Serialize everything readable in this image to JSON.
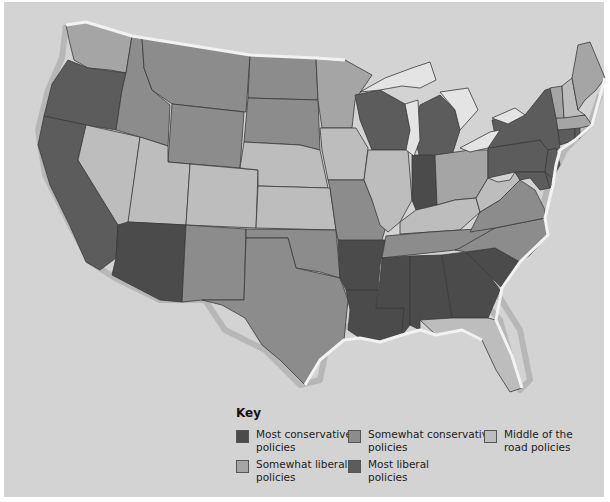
{
  "map": {
    "subject": "United States state policy leanings",
    "background_color": "#d3d3d3",
    "categories": {
      "most_conservative": {
        "label": "Most conservative policies",
        "color": "#4b4b4b"
      },
      "somewhat_conservative": {
        "label": "Somewhat conservative policies",
        "color": "#8c8c8c"
      },
      "middle": {
        "label": "Middle of the road policies",
        "color": "#bdbdbd"
      },
      "somewhat_liberal": {
        "label": "Somewhat liberal policies",
        "color": "#a5a5a5"
      },
      "most_liberal": {
        "label": "Most liberal policies",
        "color": "#5c5c5c"
      }
    },
    "states": {
      "WA": "somewhat_liberal",
      "OR": "most_liberal",
      "CA": "most_liberal",
      "ID": "somewhat_conservative",
      "NV": "middle",
      "MT": "somewhat_conservative",
      "WY": "somewhat_conservative",
      "UT": "middle",
      "AZ": "most_conservative",
      "CO": "middle",
      "NM": "somewhat_conservative",
      "ND": "somewhat_conservative",
      "SD": "somewhat_conservative",
      "NE": "middle",
      "KS": "middle",
      "OK": "somewhat_conservative",
      "TX": "somewhat_conservative",
      "MN": "somewhat_liberal",
      "IA": "middle",
      "MO": "somewhat_conservative",
      "AR": "most_conservative",
      "LA": "most_conservative",
      "WI": "most_liberal",
      "IL": "middle",
      "MI": "most_liberal",
      "IN": "most_conservative",
      "OH": "somewhat_liberal",
      "KY": "middle",
      "TN": "somewhat_conservative",
      "MS": "most_conservative",
      "AL": "most_conservative",
      "GA": "most_conservative",
      "FL": "middle",
      "SC": "most_conservative",
      "NC": "somewhat_conservative",
      "VA": "somewhat_conservative",
      "WV": "middle",
      "PA": "most_liberal",
      "NY": "most_liberal",
      "MD": "most_liberal",
      "NJ": "most_liberal",
      "DE": "most_liberal",
      "CT": "most_liberal",
      "MA": "somewhat_liberal",
      "VT": "somewhat_liberal",
      "NH": "middle",
      "ME": "somewhat_liberal",
      "RI": "most_liberal"
    }
  },
  "key": {
    "title": "Key",
    "items": [
      {
        "label": "Most conservative policies",
        "color": "#4b4b4b"
      },
      {
        "label": "Somewhat conservative policies",
        "color": "#8c8c8c"
      },
      {
        "label": "Middle of the road policies",
        "color": "#bdbdbd"
      },
      {
        "label": "Somewhat liberal policies",
        "color": "#a5a5a5"
      },
      {
        "label": "Most liberal policies",
        "color": "#5c5c5c"
      }
    ]
  }
}
